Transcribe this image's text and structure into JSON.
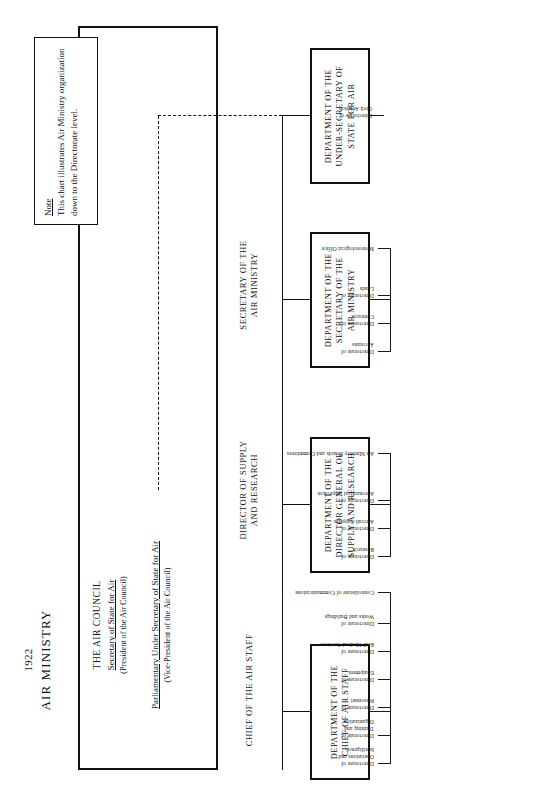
{
  "document": {
    "year": "1922",
    "title": "AIR MINISTRY"
  },
  "council": {
    "name": "THE AIR COUNCIL",
    "members": [
      {
        "role": "Secretary of State for Air",
        "position": "(President of the Air Council)"
      },
      {
        "role": "Parliamentary Under Secretary of State for Air",
        "position": "(Vice-President of the Air Council)"
      }
    ]
  },
  "roles": [
    {
      "label": "CHIEF OF THE AIR STAFF"
    },
    {
      "label": "DIRECTOR OF SUPPLY\nAND RESEARCH"
    },
    {
      "label": "SECRETARY OF THE\nAIR MINISTRY"
    }
  ],
  "departments": [
    {
      "name": "DEPARTMENT OF THE\nCHIEF OF AIR STAFF",
      "children": [
        "Directorate of\nOperations and\nIntelligence",
        "Directorate of\nTraining and\nOrganization",
        "Directorate of\nPersonnel",
        "Directorate of\nEquipment",
        "Directorate of\nRAF Medical Services",
        "Directorate of\nWorks and Buildings",
        "Controllerate of Communications"
      ]
    },
    {
      "name": "DEPARTMENT OF THE\nDIRECTOR GENERAL OF\nSUPPLY AND RESEARCH",
      "children": [
        "Directorate of\nResearch",
        "Directorate of\nAircraft Supplies",
        "Directorate of\nAeronautical Inspection",
        "Air Ministry Boards and Committees"
      ]
    },
    {
      "name": "DEPARTMENT OF THE\nSECRETARY OF THE\nAIR MINISTRY",
      "children": [
        "Directorate of\nAccounts",
        "Directorate of\nContracts",
        "Directorate of\nLands",
        "Meteorological Office"
      ]
    },
    {
      "name": "DEPARTMENT OF THE\nUNDER-SECRETARY OF\nSTATE FOR AIR",
      "children": [
        "Directorate of\nCivil Aviation"
      ]
    }
  ],
  "note": {
    "title": "Note",
    "body": "This chart illustrates Air Ministry organization down to the Directorate level."
  },
  "colors": {
    "ink": "#111111",
    "paper": "#ffffff"
  }
}
